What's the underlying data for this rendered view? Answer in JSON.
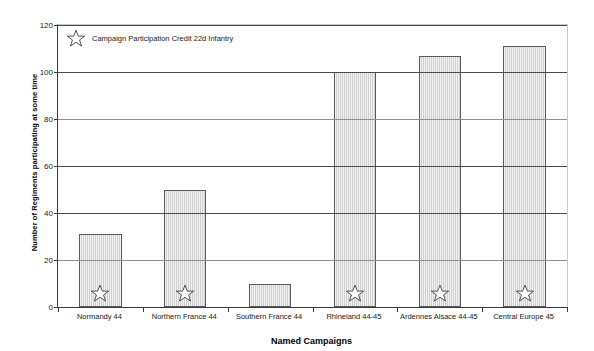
{
  "chart_data": {
    "type": "bar",
    "title": "",
    "xlabel": "Named Campaigns",
    "ylabel": "Number of Regiments participating at some time",
    "categories": [
      "Normandy 44",
      "Northern France 44",
      "Southern France 44",
      "Rhineland 44-45",
      "Ardennes Alsace 44-45",
      "Central Europe 45"
    ],
    "values": [
      31,
      50,
      10,
      100,
      107,
      111
    ],
    "ylim": [
      0,
      120
    ],
    "yticks": [
      0,
      20,
      40,
      60,
      80,
      100,
      120
    ],
    "grid": true,
    "legend_position": "top-left",
    "legend": [
      {
        "label": "Campaign Participation Credit 22d Infantry",
        "marker": "star-outline"
      }
    ],
    "annotations": [
      {
        "category": "Normandy 44",
        "marker": "star-outline"
      },
      {
        "category": "Northern France 44",
        "marker": "star-outline"
      },
      {
        "category": "Rhineland 44-45",
        "marker": "star-outline"
      },
      {
        "category": "Ardennes Alsace 44-45",
        "marker": "star-outline"
      },
      {
        "category": "Central Europe 45",
        "marker": "star-outline"
      }
    ]
  },
  "colors": {
    "bar_fill": "#cfcfcf",
    "bar_border": "#5a5a5a",
    "gridline": "#4a4a4a",
    "axis": "#3a3a3a",
    "background": "#ffffff",
    "text": "#1a1a1a"
  },
  "ytick_labels": [
    "0",
    "20",
    "40",
    "60",
    "80",
    "100",
    "120"
  ],
  "legend_label": "Campaign Participation Credit 22d Infantry",
  "x_axis_title": "Named Campaigns",
  "y_axis_title": "Number of Regiments participating at some time",
  "x_labels": [
    "Normandy 44",
    "Northern France 44",
    "Southern France 44",
    "Rhineland 44-45",
    "Ardennes Alsace 44-45",
    "Central Europe 45"
  ]
}
